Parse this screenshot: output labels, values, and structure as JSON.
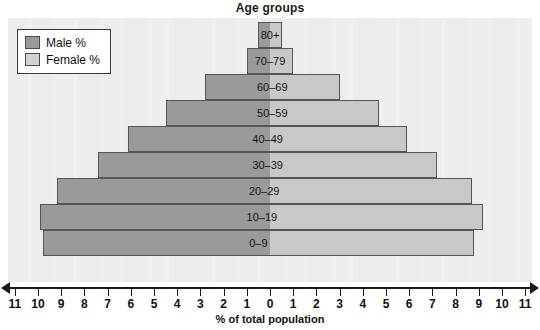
{
  "chart_data": {
    "type": "bar",
    "title": "Age groups",
    "xlabel": "% of total population",
    "ylabel": "",
    "orientation": "horizontal",
    "layout": "population-pyramid",
    "grid": false,
    "legend_position": "top-left",
    "xlim": [
      -11,
      11
    ],
    "xtick_labels": [
      "11",
      "10",
      "9",
      "8",
      "7",
      "6",
      "5",
      "4",
      "3",
      "2",
      "1",
      "0",
      "1",
      "2",
      "3",
      "4",
      "5",
      "6",
      "7",
      "8",
      "9",
      "10",
      "11"
    ],
    "xtick_values": [
      -11,
      -10,
      -9,
      -8,
      -7,
      -6,
      -5,
      -4,
      -3,
      -2,
      -1,
      0,
      1,
      2,
      3,
      4,
      5,
      6,
      7,
      8,
      9,
      10,
      11
    ],
    "categories": [
      "80+",
      "70–79",
      "60–69",
      "50–59",
      "40–49",
      "30–39",
      "20–29",
      "10–19",
      "0–9"
    ],
    "series": [
      {
        "name": "Male %",
        "color": "#9a9a9a",
        "side": "left",
        "values": [
          0.5,
          1.0,
          2.8,
          4.5,
          6.1,
          7.4,
          9.2,
          9.9,
          9.8
        ]
      },
      {
        "name": "Female %",
        "color": "#c8c8c8",
        "side": "right",
        "values": [
          0.5,
          1.0,
          3.0,
          4.7,
          5.9,
          7.2,
          8.7,
          9.2,
          8.8
        ]
      }
    ]
  },
  "legend": {
    "items": [
      {
        "label": "Male %",
        "swatch": "male"
      },
      {
        "label": "Female %",
        "swatch": "female"
      }
    ]
  }
}
